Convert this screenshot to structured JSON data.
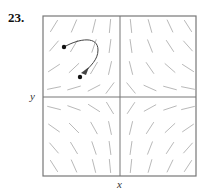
{
  "figure": {
    "problem_number": "23.",
    "x_label": "x",
    "y_label": "y",
    "frame": {
      "left": 43,
      "top": 16,
      "right": 196,
      "bottom": 176,
      "cx": 120,
      "cy": 97
    },
    "colors": {
      "frame": "#777777",
      "arrows": "#b0b0b0",
      "trajectory": "#444444",
      "points": "#111111"
    },
    "vector_field": {
      "description": "Direction field with 8x8 grid of arrows; arrows generally point away from the y-axis horizontally and toward the center/away in a saddle-like pattern",
      "grid_cols_x": [
        54,
        74,
        94,
        110,
        131,
        150,
        170,
        188
      ],
      "grid_rows_y": [
        26,
        46,
        68,
        88,
        108,
        128,
        148,
        166
      ]
    },
    "trajectory": {
      "start_point": [
        64,
        47
      ],
      "end_point": [
        80,
        77
      ],
      "has_arrowhead": true
    }
  }
}
